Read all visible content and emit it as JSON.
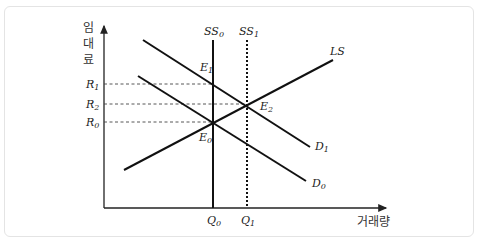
{
  "diagram": {
    "title": "",
    "y_axis_label": [
      "임",
      "대",
      "료"
    ],
    "x_axis_label": "거래량",
    "price_levels": [
      {
        "id": "R1",
        "base": "R",
        "sub": "1",
        "y": 84
      },
      {
        "id": "R2",
        "base": "R",
        "sub": "2",
        "y": 104
      },
      {
        "id": "R0",
        "base": "R",
        "sub": "0",
        "y": 122
      }
    ],
    "quantity_levels": [
      {
        "id": "Q0",
        "base": "Q",
        "sub": "0",
        "x": 213
      },
      {
        "id": "Q1",
        "base": "Q",
        "sub": "1",
        "x": 247
      }
    ],
    "curves": [
      {
        "id": "SS0",
        "base": "SS",
        "sub": "0",
        "style": "solid",
        "type": "short-run supply (vertical)"
      },
      {
        "id": "SS1",
        "base": "SS",
        "sub": "1",
        "style": "dotted",
        "type": "short-run supply (vertical)"
      },
      {
        "id": "LS",
        "base": "LS",
        "sub": "",
        "style": "solid",
        "type": "long-run supply"
      },
      {
        "id": "D0",
        "base": "D",
        "sub": "0",
        "style": "solid",
        "type": "demand"
      },
      {
        "id": "D1",
        "base": "D",
        "sub": "1",
        "style": "solid",
        "type": "demand"
      }
    ],
    "equilibria": [
      {
        "id": "E0",
        "base": "E",
        "sub": "0",
        "at": "SS0 ∩ D0 ∩ LS",
        "rent": "R0",
        "quantity": "Q0"
      },
      {
        "id": "E1",
        "base": "E",
        "sub": "1",
        "at": "SS0 ∩ D1",
        "rent": "R1",
        "quantity": "Q0"
      },
      {
        "id": "E2",
        "base": "E",
        "sub": "2",
        "at": "SS1 ∩ D1 ∩ LS",
        "rent": "R2",
        "quantity": "Q1"
      }
    ]
  }
}
